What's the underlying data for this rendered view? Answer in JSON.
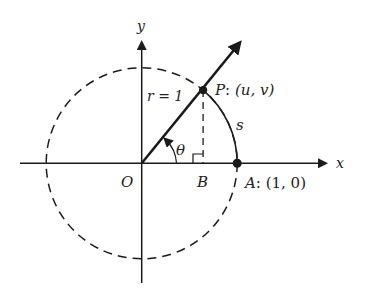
{
  "diagram": {
    "axes": {
      "x_label": "x",
      "y_label": "y",
      "origin_label": "O"
    },
    "radius_label": "r = 1",
    "angle_label": "θ",
    "arc_label": "s",
    "point_P": {
      "name": "P",
      "coords": "(u, v)"
    },
    "point_A": {
      "name": "A",
      "coords": "(1, 0)"
    },
    "point_B": {
      "name": "B"
    },
    "colors": {
      "stroke": "#1a1a1a",
      "background": "#ffffff"
    }
  }
}
